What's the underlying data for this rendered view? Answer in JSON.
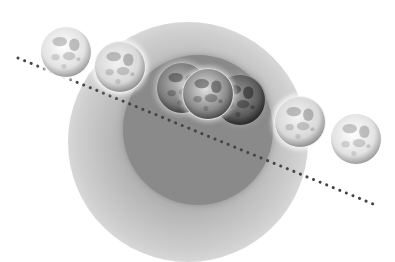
{
  "diagram": {
    "colors": {
      "background": "#ffffff",
      "penumbra": "#b4b4b4",
      "umbra": "#8a8a8a",
      "moon_bright": "#e6e6e6",
      "moon_dark": "#4a4a4a",
      "ecliptic_dots": "#444444"
    },
    "shadow": {
      "penumbra": {
        "cx": 188,
        "cy": 142,
        "r": 120
      },
      "umbra": {
        "cx": 198,
        "cy": 130,
        "r": 75
      }
    },
    "ecliptic_line": {
      "x1": 18,
      "y1": 58,
      "x2": 378,
      "y2": 206,
      "style": "dotted"
    },
    "moons": [
      {
        "id": "moon-1",
        "cx": 66,
        "cy": 52,
        "r": 26,
        "phase": "full"
      },
      {
        "id": "moon-2",
        "cx": 120,
        "cy": 67,
        "r": 26,
        "phase": "penumbral"
      },
      {
        "id": "moon-3",
        "cx": 182,
        "cy": 88,
        "r": 26,
        "phase": "partial"
      },
      {
        "id": "moon-4",
        "cx": 240,
        "cy": 100,
        "r": 26,
        "phase": "total-dark"
      },
      {
        "id": "moon-5",
        "cx": 208,
        "cy": 94,
        "r": 26,
        "phase": "total"
      },
      {
        "id": "moon-6",
        "cx": 300,
        "cy": 122,
        "r": 26,
        "phase": "penumbral"
      },
      {
        "id": "moon-7",
        "cx": 356,
        "cy": 139,
        "r": 26,
        "phase": "full"
      }
    ]
  }
}
